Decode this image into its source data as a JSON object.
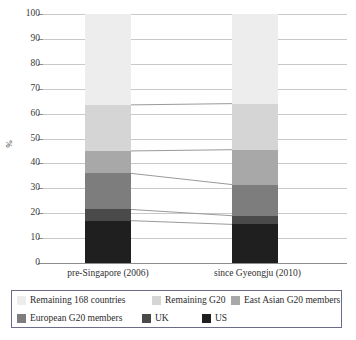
{
  "chart_data": {
    "type": "bar",
    "stacked": true,
    "title": "",
    "xlabel": "",
    "ylabel": "%",
    "ylim": [
      0,
      100
    ],
    "ytick_labels": [
      "0",
      "10",
      "20",
      "30",
      "40",
      "50",
      "60",
      "70",
      "80",
      "90",
      "100"
    ],
    "ytick_values": [
      0,
      10,
      20,
      30,
      40,
      50,
      60,
      70,
      80,
      90,
      100
    ],
    "grid": true,
    "legend_position": "bottom",
    "categories": [
      "pre-Singapore (2006)",
      "since Gyeongju (2010)"
    ],
    "series": [
      {
        "name": "US",
        "color": "#1f1f1f",
        "values": [
          17.0,
          15.5
        ]
      },
      {
        "name": "UK",
        "color": "#4a4a4a",
        "values": [
          4.5,
          3.5
        ]
      },
      {
        "name": "European G20 members",
        "color": "#7d7d7d",
        "values": [
          14.5,
          12.5
        ]
      },
      {
        "name": "East Asian G20 members",
        "color": "#a8a8a8",
        "values": [
          9.0,
          14.0
        ]
      },
      {
        "name": "Remaining G20",
        "color": "#d5d5d5",
        "values": [
          18.5,
          18.5
        ]
      },
      {
        "name": "Remaining 168 countries",
        "color": "#ededed",
        "values": [
          36.5,
          36.0
        ]
      }
    ],
    "cumulative_tops": {
      "pre-Singapore (2006)": [
        17.0,
        21.5,
        36.0,
        45.0,
        63.5,
        100.0
      ],
      "since Gyeongju (2010)": [
        15.5,
        19.0,
        31.5,
        45.5,
        64.0,
        100.0
      ]
    },
    "connector_lines": [
      {
        "from": 17.0,
        "to": 15.5
      },
      {
        "from": 21.5,
        "to": 19.0
      },
      {
        "from": 36.0,
        "to": 31.5
      },
      {
        "from": 45.0,
        "to": 45.5
      },
      {
        "from": 63.5,
        "to": 64.0
      }
    ]
  },
  "legend": {
    "rows": [
      [
        {
          "label": "Remaining 168 countries",
          "color": "#ededed",
          "left": 5
        },
        {
          "label": "Remaining G20",
          "color": "#d5d5d5",
          "left": 140
        },
        {
          "label": "East Asian G20 members",
          "color": "#a8a8a8",
          "left": 219
        }
      ],
      [
        {
          "label": "European G20 members",
          "color": "#7d7d7d",
          "left": 5
        },
        {
          "label": "UK",
          "color": "#4a4a4a",
          "left": 130
        },
        {
          "label": "US",
          "color": "#1f1f1f",
          "left": 190
        }
      ]
    ]
  },
  "colors": {
    "grid": "#c9c9c9",
    "axis": "#8d8d8d",
    "connector": "#9a9a9a",
    "legend_border": "#6b6b8a",
    "background": "#ffffff"
  }
}
